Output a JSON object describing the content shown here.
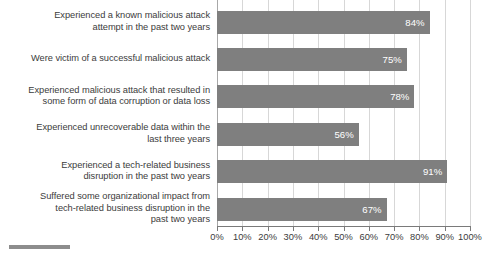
{
  "chart_data": {
    "type": "bar",
    "orientation": "horizontal",
    "title": "",
    "xlabel": "",
    "ylabel": "",
    "xlim": [
      0,
      100
    ],
    "xtick_step": 10,
    "grid": true,
    "legend": "none",
    "value_label_suffix": "%",
    "bar_color": "#7f7f7f",
    "value_label_color": "#ffffff",
    "gridline_color": "#d7d7d7",
    "axis_color": "#7a7a7a",
    "categories": [
      "Experienced a known malicious attack attempt in the past two years",
      "Were victim of a successful malicious attack",
      "Experienced malicious attack that resulted in some form of data corruption or data loss",
      "Experienced unrecoverable data within the last three years",
      "Experienced a tech-related business disruption in the past two years",
      "Suffered some organizational impact from tech-related business disruption in the past two years"
    ],
    "category_lines": [
      [
        "Experienced a known malicious attack",
        "attempt in the past two years"
      ],
      [
        "Were victim of a successful malicious attack"
      ],
      [
        "Experienced malicious attack that resulted in",
        "some form of data corruption or data loss"
      ],
      [
        "Experienced unrecoverable data within the",
        "last three years"
      ],
      [
        "Experienced a tech-related business",
        "disruption in the past two years"
      ],
      [
        "Suffered some organizational impact from",
        "tech-related business disruption in the",
        "past two years"
      ]
    ],
    "values": [
      84,
      75,
      78,
      56,
      91,
      67
    ],
    "value_labels": [
      "84%",
      "75%",
      "78%",
      "56%",
      "91%",
      "67%"
    ],
    "xtick_labels": [
      "0%",
      "10%",
      "20%",
      "30%",
      "40%",
      "50%",
      "60%",
      "70%",
      "80%",
      "90%",
      "100%"
    ],
    "xtick_values": [
      0,
      10,
      20,
      30,
      40,
      50,
      60,
      70,
      80,
      90,
      100
    ]
  }
}
